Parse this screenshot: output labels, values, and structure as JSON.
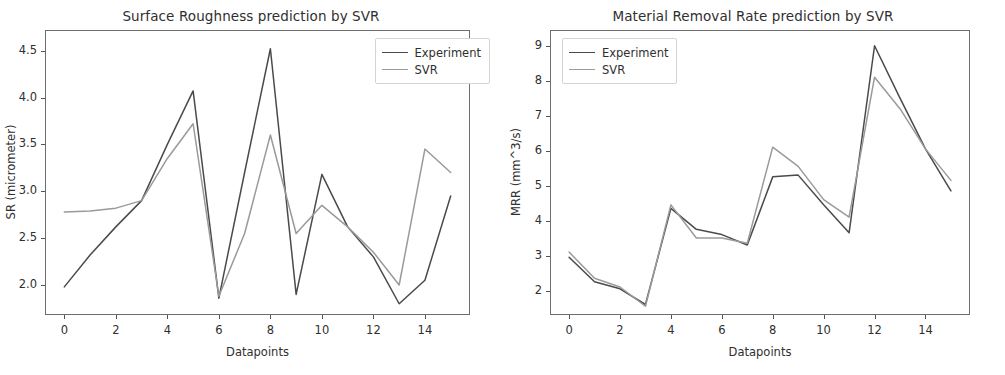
{
  "figure": {
    "background": "#ffffff",
    "series_colors": {
      "experiment": "#4a4a4a",
      "svr": "#9a9a9a"
    }
  },
  "chart_data": [
    {
      "type": "line",
      "panel": "left",
      "title": "Surface Roughness prediction by SVR",
      "xlabel": "Datapoints",
      "ylabel": "SR (micrometer)",
      "xlim": [
        -0.75,
        15.75
      ],
      "ylim": [
        1.68,
        4.72
      ],
      "xticks": [
        0,
        2,
        4,
        6,
        8,
        10,
        12,
        14
      ],
      "xtick_labels": [
        "0",
        "2",
        "4",
        "6",
        "8",
        "10",
        "12",
        "14"
      ],
      "yticks": [
        2.0,
        2.5,
        3.0,
        3.5,
        4.0,
        4.5
      ],
      "ytick_labels": [
        "2.0",
        "2.5",
        "3.0",
        "3.5",
        "4.0",
        "4.5"
      ],
      "grid": false,
      "legend_position": "upper right",
      "x": [
        0,
        1,
        2,
        3,
        4,
        5,
        6,
        7,
        8,
        9,
        10,
        11,
        12,
        13,
        14,
        15
      ],
      "series": [
        {
          "name": "Experiment",
          "color": "#4a4a4a",
          "values": [
            1.98,
            2.32,
            2.62,
            2.9,
            3.5,
            4.07,
            1.86,
            3.2,
            4.52,
            1.9,
            3.18,
            2.62,
            2.3,
            1.8,
            2.05,
            2.95
          ]
        },
        {
          "name": "SVR",
          "color": "#9a9a9a",
          "values": [
            2.78,
            2.79,
            2.82,
            2.9,
            3.35,
            3.72,
            1.88,
            2.55,
            3.6,
            2.55,
            2.85,
            2.62,
            2.35,
            2.0,
            3.45,
            3.2
          ]
        }
      ]
    },
    {
      "type": "line",
      "panel": "right",
      "title": "Material Removal Rate prediction by SVR",
      "xlabel": "Datapoints",
      "ylabel": "MRR (mm^3/s)",
      "xlim": [
        -0.75,
        15.75
      ],
      "ylim": [
        1.3,
        9.45
      ],
      "xticks": [
        0,
        2,
        4,
        6,
        8,
        10,
        12,
        14
      ],
      "xtick_labels": [
        "0",
        "2",
        "4",
        "6",
        "8",
        "10",
        "12",
        "14"
      ],
      "yticks": [
        2,
        3,
        4,
        5,
        6,
        7,
        8,
        9
      ],
      "ytick_labels": [
        "2",
        "3",
        "4",
        "5",
        "6",
        "7",
        "8",
        "9"
      ],
      "grid": false,
      "legend_position": "upper left",
      "x": [
        0,
        1,
        2,
        3,
        4,
        5,
        6,
        7,
        8,
        9,
        10,
        11,
        12,
        13,
        14,
        15
      ],
      "series": [
        {
          "name": "Experiment",
          "color": "#4a4a4a",
          "values": [
            2.95,
            2.25,
            2.05,
            1.6,
            4.35,
            3.75,
            3.6,
            3.3,
            5.25,
            5.3,
            4.45,
            3.65,
            9.0,
            7.5,
            6.05,
            4.85
          ]
        },
        {
          "name": "SVR",
          "color": "#9a9a9a",
          "values": [
            3.1,
            2.35,
            2.1,
            1.55,
            4.45,
            3.5,
            3.5,
            3.35,
            6.1,
            5.55,
            4.6,
            4.1,
            8.1,
            7.2,
            6.05,
            5.15
          ]
        }
      ]
    }
  ],
  "legend": {
    "experiment_label": "Experiment",
    "svr_label": "SVR"
  }
}
